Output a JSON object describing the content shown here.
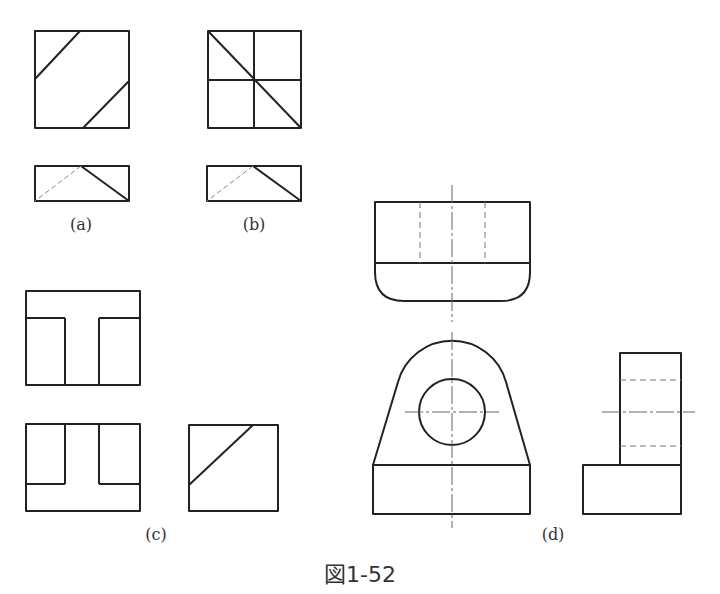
{
  "figure": {
    "caption": "図1-52",
    "labels": {
      "a": "(a)",
      "b": "(b)",
      "c": "(c)",
      "d": "(d)"
    }
  },
  "colors": {
    "line": "#222222",
    "hidden": "#777777",
    "center": "#666666"
  }
}
